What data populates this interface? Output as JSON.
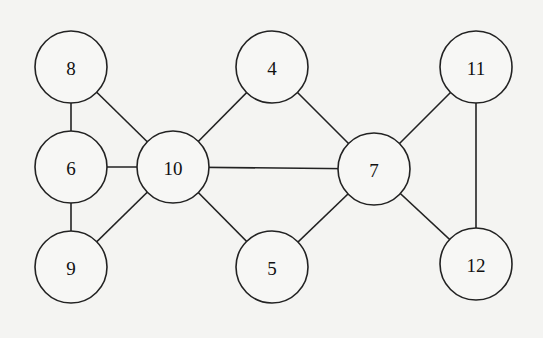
{
  "diagram": {
    "type": "undirected-graph",
    "node_radius": 36,
    "nodes": [
      {
        "id": "8",
        "label": "8",
        "x": 71,
        "y": 67
      },
      {
        "id": "4",
        "label": "4",
        "x": 272,
        "y": 67
      },
      {
        "id": "11",
        "label": "11",
        "x": 476,
        "y": 67
      },
      {
        "id": "6",
        "label": "6",
        "x": 71,
        "y": 167
      },
      {
        "id": "10",
        "label": "10",
        "x": 173,
        "y": 167
      },
      {
        "id": "7",
        "label": "7",
        "x": 374,
        "y": 169
      },
      {
        "id": "9",
        "label": "9",
        "x": 71,
        "y": 267
      },
      {
        "id": "5",
        "label": "5",
        "x": 272,
        "y": 267
      },
      {
        "id": "12",
        "label": "12",
        "x": 476,
        "y": 264
      }
    ],
    "edges": [
      [
        "8",
        "6"
      ],
      [
        "8",
        "10"
      ],
      [
        "6",
        "10"
      ],
      [
        "6",
        "9"
      ],
      [
        "9",
        "10"
      ],
      [
        "10",
        "4"
      ],
      [
        "10",
        "7"
      ],
      [
        "10",
        "5"
      ],
      [
        "4",
        "7"
      ],
      [
        "7",
        "5"
      ],
      [
        "7",
        "11"
      ],
      [
        "7",
        "12"
      ],
      [
        "11",
        "12"
      ]
    ]
  }
}
